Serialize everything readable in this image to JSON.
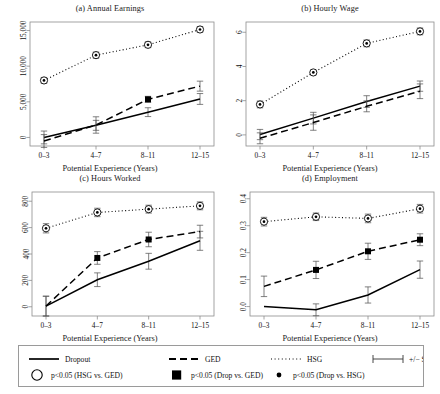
{
  "figure": {
    "width": 440,
    "height": 394,
    "background": "#ffffff",
    "axis_color": "#8d8d8d",
    "line_color": "#000000"
  },
  "shared": {
    "xlabel": "Potential Experience (Years)",
    "xticks": [
      "0–3",
      "4–7",
      "8–11",
      "12–15"
    ]
  },
  "legend": {
    "entries": [
      {
        "key": "line-solid",
        "label": "Dropout",
        "marker": "solid-line"
      },
      {
        "key": "line-dashed",
        "label": "GED",
        "marker": "dashed-line"
      },
      {
        "key": "line-dotted",
        "label": "HSG",
        "marker": "dotted-line"
      },
      {
        "key": "errorbar",
        "label": "+/− S.E.",
        "marker": "errorbar"
      },
      {
        "key": "open-circle",
        "label": "p<0.05 (HSG vs. GED)",
        "marker": "open-circle"
      },
      {
        "key": "filled-square",
        "label": "p<0.05 (Drop vs. GED)",
        "marker": "filled-square"
      },
      {
        "key": "small-dot",
        "label": "p<0.05 (Drop vs. HSG)",
        "marker": "small-dot"
      }
    ]
  },
  "chart_data": [
    {
      "id": "panel-a",
      "type": "line",
      "title": "(a) Annual Earnings",
      "xlabel": "Potential Experience (Years)",
      "ylabel": "",
      "categories": [
        "0–3",
        "4–7",
        "8–11",
        "12–15"
      ],
      "yticks": [
        0,
        5000,
        10000,
        15000
      ],
      "yticklabels": [
        "0",
        "5,000",
        "10,000",
        "15,000"
      ],
      "ylim": [
        -1200,
        16200
      ],
      "grid": false,
      "legend_position": "below-figure",
      "series": [
        {
          "name": "Dropout",
          "style": "solid",
          "values": [
            0,
            1700,
            3550,
            5400
          ],
          "se": [
            900,
            700,
            620,
            760
          ],
          "markers": [
            null,
            null,
            null,
            null
          ]
        },
        {
          "name": "GED",
          "style": "dashed",
          "values": [
            -500,
            1750,
            5350,
            7200
          ],
          "se": [
            900,
            1150,
            420,
            700
          ],
          "markers": [
            null,
            null,
            "filled-square",
            null
          ]
        },
        {
          "name": "HSG",
          "style": "dotted",
          "values": [
            8000,
            11550,
            13000,
            15150
          ],
          "se": [
            420,
            430,
            400,
            400
          ],
          "markers": [
            "open-circle",
            "open-circle",
            "open-circle",
            "open-circle"
          ]
        }
      ]
    },
    {
      "id": "panel-b",
      "type": "line",
      "title": "(b) Hourly Wage",
      "xlabel": "Potential Experience (Years)",
      "ylabel": "",
      "categories": [
        "0–3",
        "4–7",
        "8–11",
        "12–15"
      ],
      "yticks": [
        0,
        2,
        4,
        6
      ],
      "yticklabels": [
        "0",
        "2",
        "4",
        "6"
      ],
      "ylim": [
        -0.65,
        6.6
      ],
      "grid": false,
      "legend_position": "below-figure",
      "series": [
        {
          "name": "Dropout",
          "style": "solid",
          "values": [
            0.02,
            0.98,
            1.95,
            2.85
          ],
          "se": [
            0.3,
            0.34,
            0.34,
            0.3
          ],
          "markers": [
            null,
            null,
            null,
            null
          ]
        },
        {
          "name": "GED",
          "style": "dashed",
          "values": [
            -0.2,
            0.72,
            1.67,
            2.55
          ],
          "se": [
            0.32,
            0.45,
            0.32,
            0.43
          ],
          "markers": [
            null,
            null,
            null,
            null
          ]
        },
        {
          "name": "HSG",
          "style": "dotted",
          "values": [
            1.78,
            3.65,
            5.35,
            6.05
          ],
          "se": [
            0.2,
            0.14,
            0.2,
            0.2
          ],
          "markers": [
            "open-circle",
            "open-circle",
            "open-circle",
            "open-circle"
          ]
        }
      ]
    },
    {
      "id": "panel-c",
      "type": "line",
      "title": "(c) Hours Worked",
      "xlabel": "Potential Experience (Years)",
      "ylabel": "",
      "categories": [
        "0–3",
        "4–7",
        "8–11",
        "12–15"
      ],
      "yticks": [
        0,
        200,
        400,
        600,
        800
      ],
      "yticklabels": [
        "0",
        "200",
        "400",
        "600",
        "800"
      ],
      "ylim": [
        -70,
        870
      ],
      "grid": false,
      "legend_position": "below-figure",
      "series": [
        {
          "name": "Dropout",
          "style": "solid",
          "values": [
            5,
            205,
            345,
            500
          ],
          "se": [
            75,
            52,
            60,
            72
          ],
          "markers": [
            null,
            null,
            null,
            null
          ]
        },
        {
          "name": "GED",
          "style": "dashed",
          "values": [
            5,
            370,
            510,
            570
          ],
          "se": [
            75,
            48,
            55,
            48
          ],
          "markers": [
            null,
            "filled-square",
            "filled-square",
            null
          ]
        },
        {
          "name": "HSG",
          "style": "dotted",
          "values": [
            595,
            715,
            740,
            765
          ],
          "se": [
            35,
            32,
            30,
            30
          ],
          "markers": [
            "open-circle",
            "open-circle",
            "open-circle",
            "open-circle"
          ]
        }
      ]
    },
    {
      "id": "panel-d",
      "type": "line",
      "title": "(d) Employment",
      "xlabel": "Potential Experience (Years)",
      "ylabel": "",
      "categories": [
        "0–3",
        "4–7",
        "8–11",
        "12–15"
      ],
      "yticks": [
        0.0,
        0.1,
        0.2,
        0.3,
        0.4
      ],
      "yticklabels": [
        "0.0",
        "0.1",
        "0.2",
        "0.3",
        "0.4"
      ],
      "ylim": [
        -0.035,
        0.425
      ],
      "grid": false,
      "legend_position": "below-figure",
      "series": [
        {
          "name": "Dropout",
          "style": "solid",
          "values": [
            0.0,
            -0.012,
            0.043,
            0.137
          ],
          "se": [
            0.0,
            0.022,
            0.03,
            0.032
          ],
          "markers": [
            null,
            null,
            null,
            null
          ]
        },
        {
          "name": "GED",
          "style": "dashed",
          "values": [
            0.075,
            0.136,
            0.205,
            0.248
          ],
          "se": [
            0.038,
            0.032,
            0.03,
            0.022
          ],
          "markers": [
            null,
            "filled-square",
            "filled-square",
            "filled-square"
          ]
        },
        {
          "name": "HSG",
          "style": "dotted",
          "values": [
            0.315,
            0.333,
            0.327,
            0.363
          ],
          "se": [
            0.016,
            0.014,
            0.016,
            0.016
          ],
          "markers": [
            "open-circle",
            "open-circle",
            "open-circle",
            "open-circle"
          ]
        }
      ]
    }
  ]
}
